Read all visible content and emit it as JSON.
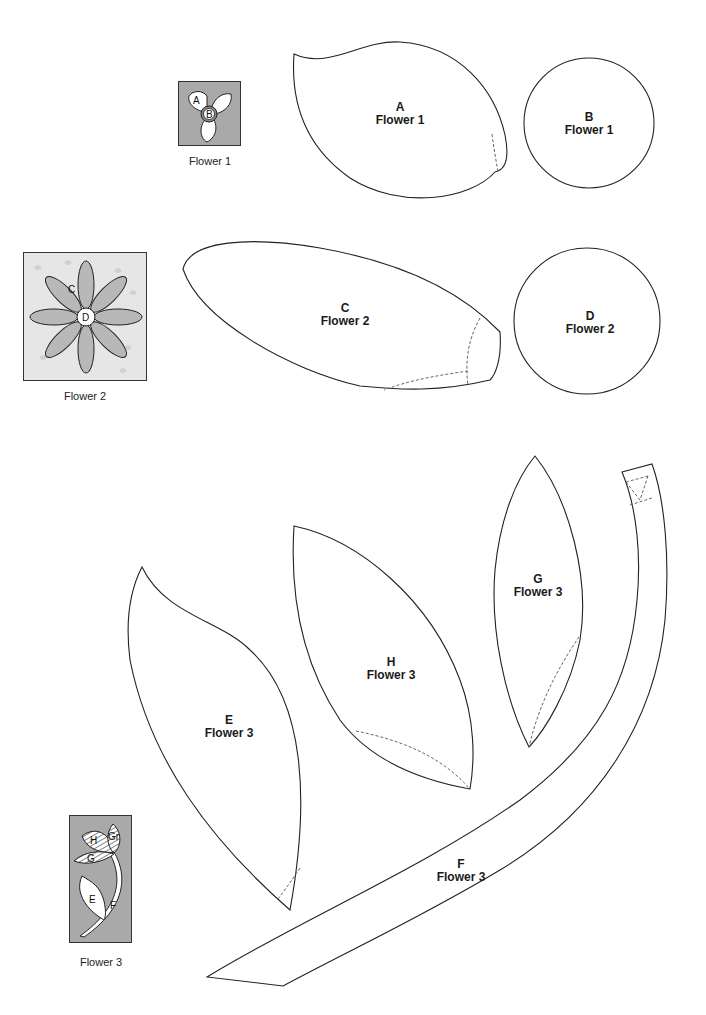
{
  "pieces": [
    {
      "letter": "A",
      "flower": "Flower 1",
      "shape": "petal"
    },
    {
      "letter": "B",
      "flower": "Flower 1",
      "shape": "circle"
    },
    {
      "letter": "C",
      "flower": "Flower 2",
      "shape": "elongated-petal"
    },
    {
      "letter": "D",
      "flower": "Flower 2",
      "shape": "circle"
    },
    {
      "letter": "E",
      "flower": "Flower 3",
      "shape": "leaf"
    },
    {
      "letter": "F",
      "flower": "Flower 3",
      "shape": "stem"
    },
    {
      "letter": "G",
      "flower": "Flower 3",
      "shape": "leaf"
    },
    {
      "letter": "H",
      "flower": "Flower 3",
      "shape": "leaf"
    }
  ],
  "thumbnails": [
    {
      "caption": "Flower 1",
      "labels": [
        "A",
        "B"
      ],
      "background": "#a9a9a9"
    },
    {
      "caption": "Flower 2",
      "labels": [
        "C",
        "D"
      ],
      "background": "#e6e6e6"
    },
    {
      "caption": "Flower 3",
      "labels": [
        "H",
        "Gr",
        "G",
        "E",
        "F"
      ],
      "background": "#a9a9a9"
    }
  ],
  "colors": {
    "outline": "#222222",
    "dashed": "#666666",
    "thumb_fill": "#a9a9a9",
    "petal_fill": "#b8b8b8"
  }
}
